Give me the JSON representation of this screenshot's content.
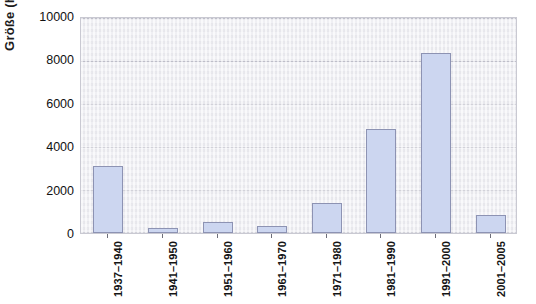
{
  "chart_data": {
    "type": "bar",
    "title": "",
    "subtitle": "",
    "xlabel": "",
    "ylabel": "Größe (ha)",
    "categories": [
      "1937–1940",
      "1941–1950",
      "1951–1960",
      "1961–1970",
      "1971–1980",
      "1981–1990",
      "1991–2000",
      "2001–2005"
    ],
    "values": [
      3100,
      250,
      510,
      340,
      1400,
      4800,
      8320,
      850
    ],
    "ylim": [
      0,
      10000
    ],
    "yticks": [
      0,
      2000,
      4000,
      6000,
      8000,
      10000
    ],
    "ytick_labels": [
      "0",
      "2000",
      "4000",
      "6000",
      "8000",
      "10000"
    ],
    "grid": true,
    "grid_axis": "y",
    "legend": null,
    "legend_position": "none",
    "bar_fill_color": "#ccd6f0",
    "bar_edge_color": "#8d93b3",
    "plot_background_color": "#ededf2",
    "grid_color": "#c2c2cd"
  }
}
